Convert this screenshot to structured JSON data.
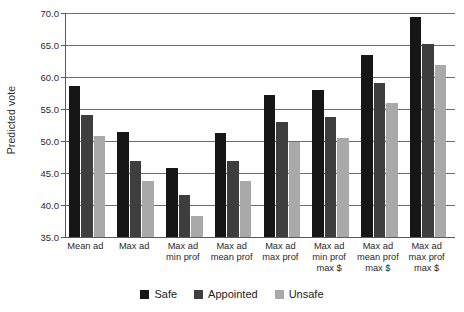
{
  "chart_data": {
    "type": "bar",
    "title": "",
    "xlabel": "",
    "ylabel": "Predicted vote",
    "ylim": [
      35.0,
      70.0
    ],
    "ytick_labels": [
      "35.0",
      "40.0",
      "45.0",
      "50.0",
      "55.0",
      "60.0",
      "65.0",
      "70.0"
    ],
    "ytick_values": [
      35.0,
      40.0,
      45.0,
      50.0,
      55.0,
      60.0,
      65.0,
      70.0
    ],
    "grid": "horizontal",
    "legend_position": "bottom-center",
    "categories": [
      "Mean ad",
      "Max ad",
      "Max ad\nmin prof",
      "Max ad\nmean prof",
      "Max ad\nmax prof",
      "Max ad\nmin prof\nmax $",
      "Max ad\nmean prof\nmax $",
      "Max ad\nmax prof\nmax $"
    ],
    "series": [
      {
        "name": "Safe",
        "color": "#161616",
        "values": [
          58.6,
          51.4,
          45.8,
          51.2,
          57.2,
          57.9,
          63.4,
          69.3
        ]
      },
      {
        "name": "Appointed",
        "color": "#3e3e3e",
        "values": [
          54.0,
          46.9,
          41.5,
          46.9,
          53.0,
          53.7,
          59.1,
          65.2
        ]
      },
      {
        "name": "Unsafe",
        "color": "#a9a9a9",
        "values": [
          50.8,
          43.8,
          38.3,
          43.7,
          49.8,
          50.4,
          56.0,
          61.9
        ]
      }
    ]
  }
}
